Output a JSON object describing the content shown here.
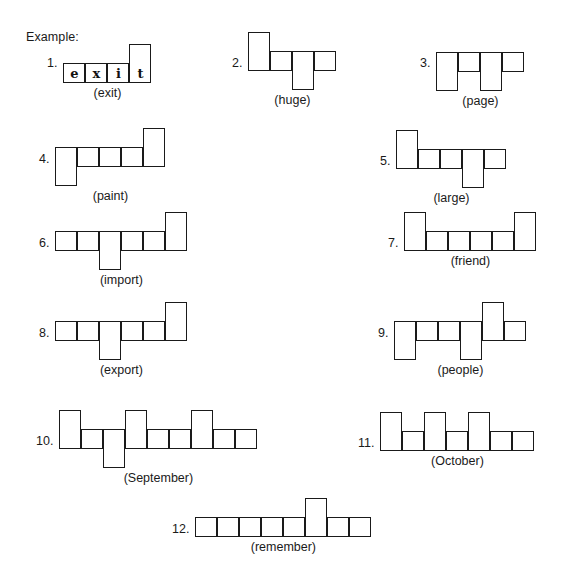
{
  "worksheet": {
    "example_label": "Example:",
    "geometry": {
      "cell_width": 22,
      "x_height": 20,
      "ascender_extra": 19,
      "descender_extra": 19
    },
    "legend": {
      "tall": "ascender box extends above the x-height line",
      "normal": "box sits on the x-height line",
      "drop": "descender box extends below the x-height line"
    },
    "puzzles": [
      {
        "number": "1.",
        "caption": "(exit)",
        "word": "exit",
        "filled": true,
        "left": 47,
        "top": 44,
        "number_offset_top": 13,
        "cells": [
          {
            "letter": "e",
            "type": "normal"
          },
          {
            "letter": "x",
            "type": "normal"
          },
          {
            "letter": "i",
            "type": "normal"
          },
          {
            "letter": "t",
            "type": "tall"
          }
        ]
      },
      {
        "number": "2.",
        "caption": "(huge)",
        "word": "huge",
        "filled": false,
        "left": 232,
        "top": 32,
        "number_offset_top": 25,
        "cells": [
          {
            "letter": "h",
            "type": "tall"
          },
          {
            "letter": "u",
            "type": "normal"
          },
          {
            "letter": "g",
            "type": "drop"
          },
          {
            "letter": "e",
            "type": "normal"
          }
        ]
      },
      {
        "number": "3.",
        "caption": "(page)",
        "word": "page",
        "filled": false,
        "left": 420,
        "top": 52,
        "number_offset_top": 5,
        "cells": [
          {
            "letter": "p",
            "type": "drop"
          },
          {
            "letter": "a",
            "type": "normal"
          },
          {
            "letter": "g",
            "type": "drop"
          },
          {
            "letter": "e",
            "type": "normal"
          }
        ]
      },
      {
        "number": "4.",
        "caption": "(paint)",
        "word": "paint",
        "filled": false,
        "left": 39,
        "top": 128,
        "number_offset_top": 25,
        "cells": [
          {
            "letter": "p",
            "type": "drop"
          },
          {
            "letter": "a",
            "type": "normal"
          },
          {
            "letter": "i",
            "type": "normal"
          },
          {
            "letter": "n",
            "type": "normal"
          },
          {
            "letter": "t",
            "type": "tall"
          }
        ]
      },
      {
        "number": "5.",
        "caption": "(large)",
        "word": "large",
        "filled": false,
        "left": 380,
        "top": 130,
        "number_offset_top": 25,
        "cells": [
          {
            "letter": "l",
            "type": "tall"
          },
          {
            "letter": "a",
            "type": "normal"
          },
          {
            "letter": "r",
            "type": "normal"
          },
          {
            "letter": "g",
            "type": "drop"
          },
          {
            "letter": "e",
            "type": "normal"
          }
        ]
      },
      {
        "number": "6.",
        "caption": "(import)",
        "word": "import",
        "filled": false,
        "left": 39,
        "top": 212,
        "number_offset_top": 25,
        "cells": [
          {
            "letter": "i",
            "type": "normal"
          },
          {
            "letter": "m",
            "type": "normal"
          },
          {
            "letter": "p",
            "type": "drop"
          },
          {
            "letter": "o",
            "type": "normal"
          },
          {
            "letter": "r",
            "type": "normal"
          },
          {
            "letter": "t",
            "type": "tall"
          }
        ]
      },
      {
        "number": "7.",
        "caption": "(friend)",
        "word": "friend",
        "filled": false,
        "left": 388,
        "top": 212,
        "number_offset_top": 25,
        "cells": [
          {
            "letter": "f",
            "type": "tall"
          },
          {
            "letter": "r",
            "type": "normal"
          },
          {
            "letter": "i",
            "type": "normal"
          },
          {
            "letter": "e",
            "type": "normal"
          },
          {
            "letter": "n",
            "type": "normal"
          },
          {
            "letter": "d",
            "type": "tall"
          }
        ]
      },
      {
        "number": "8.",
        "caption": "(export)",
        "word": "export",
        "filled": false,
        "left": 39,
        "top": 302,
        "number_offset_top": 25,
        "cells": [
          {
            "letter": "e",
            "type": "normal"
          },
          {
            "letter": "x",
            "type": "normal"
          },
          {
            "letter": "p",
            "type": "drop"
          },
          {
            "letter": "o",
            "type": "normal"
          },
          {
            "letter": "r",
            "type": "normal"
          },
          {
            "letter": "t",
            "type": "tall"
          }
        ]
      },
      {
        "number": "9.",
        "caption": "(people)",
        "word": "people",
        "filled": false,
        "left": 378,
        "top": 302,
        "number_offset_top": 25,
        "cells": [
          {
            "letter": "p",
            "type": "drop"
          },
          {
            "letter": "e",
            "type": "normal"
          },
          {
            "letter": "o",
            "type": "normal"
          },
          {
            "letter": "p",
            "type": "drop"
          },
          {
            "letter": "l",
            "type": "tall"
          },
          {
            "letter": "e",
            "type": "normal"
          }
        ]
      },
      {
        "number": "10.",
        "caption": "(September)",
        "word": "September",
        "filled": false,
        "left": 36,
        "top": 410,
        "number_offset_top": 25,
        "cells": [
          {
            "letter": "S",
            "type": "tall"
          },
          {
            "letter": "e",
            "type": "normal"
          },
          {
            "letter": "p",
            "type": "drop"
          },
          {
            "letter": "t",
            "type": "tall"
          },
          {
            "letter": "e",
            "type": "normal"
          },
          {
            "letter": "m",
            "type": "normal"
          },
          {
            "letter": "b",
            "type": "tall"
          },
          {
            "letter": "e",
            "type": "normal"
          },
          {
            "letter": "r",
            "type": "normal"
          }
        ]
      },
      {
        "number": "11.",
        "caption": "(October)",
        "word": "October",
        "filled": false,
        "left": 358,
        "top": 412,
        "number_offset_top": 25,
        "cells": [
          {
            "letter": "O",
            "type": "tall"
          },
          {
            "letter": "c",
            "type": "normal"
          },
          {
            "letter": "t",
            "type": "tall"
          },
          {
            "letter": "o",
            "type": "normal"
          },
          {
            "letter": "b",
            "type": "tall"
          },
          {
            "letter": "e",
            "type": "normal"
          },
          {
            "letter": "r",
            "type": "normal"
          }
        ]
      },
      {
        "number": "12.",
        "caption": "(remember)",
        "word": "remember",
        "filled": false,
        "left": 172,
        "top": 498,
        "number_offset_top": 25,
        "cells": [
          {
            "letter": "r",
            "type": "normal"
          },
          {
            "letter": "e",
            "type": "normal"
          },
          {
            "letter": "m",
            "type": "normal"
          },
          {
            "letter": "e",
            "type": "normal"
          },
          {
            "letter": "m",
            "type": "normal"
          },
          {
            "letter": "b",
            "type": "tall"
          },
          {
            "letter": "e",
            "type": "normal"
          },
          {
            "letter": "r",
            "type": "normal"
          }
        ]
      }
    ]
  }
}
